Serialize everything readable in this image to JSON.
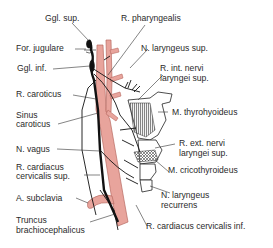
{
  "figure": {
    "type": "anatomical-diagram",
    "colors": {
      "artery_fill": "#e8a49c",
      "artery_stroke": "#b86a62",
      "nerve": "#111111",
      "muscle_hatch": "#555555",
      "label_text": "#2a2a2a",
      "leader_line": "#333333"
    },
    "labels": {
      "ggl_sup": "Ggl. sup.",
      "for_jugulare": "For. jugulare",
      "ggl_inf": "Ggl. inf.",
      "r_caroticus": "R. caroticus",
      "sinus_caroticus_1": "Sinus",
      "sinus_caroticus_2": "caroticus",
      "n_vagus": "N. vagus",
      "r_cardiacus_sup_1": "R. cardiacus",
      "r_cardiacus_sup_2": "cervicalis sup.",
      "a_subclavia": "A. subclavia",
      "truncus_1": "Truncus",
      "truncus_2": "brachiocephalicus",
      "r_pharyngealis": "R. pharyngealis",
      "n_laryngeus_sup": "N. laryngeus sup.",
      "r_int_1": "R. int. nervi",
      "r_int_2": "laryngei sup.",
      "m_thyrohyoideus": "M. thyrohyoideus",
      "r_ext_1": "R. ext. nervi",
      "r_ext_2": "laryngei sup.",
      "m_cricothyroideus": "M. cricothyroideus",
      "n_laryngeus_rec_1": "N. laryngeus",
      "n_laryngeus_rec_2": "recurrens",
      "r_cardiacus_inf": "R. cardiacus cervicalis inf."
    }
  }
}
